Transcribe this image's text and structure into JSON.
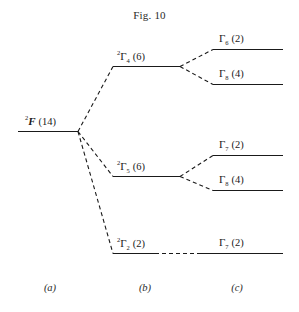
{
  "figure": {
    "title": "Fig. 10",
    "columns": [
      {
        "id": "a",
        "label": "(a)"
      },
      {
        "id": "b",
        "label": "(b)"
      },
      {
        "id": "c",
        "label": "(c)"
      }
    ],
    "levels": [
      {
        "id": "free-ion-2F",
        "column": "a",
        "prefix": "2",
        "symbol": "F",
        "subscript": "",
        "degeneracy": "(14)",
        "bold_italic": true
      },
      {
        "id": "gamma-4",
        "column": "b",
        "prefix": "2",
        "symbol": "Γ",
        "subscript": "4",
        "degeneracy": "(6)",
        "bold_italic": false
      },
      {
        "id": "gamma-5",
        "column": "b",
        "prefix": "2",
        "symbol": "Γ",
        "subscript": "5",
        "degeneracy": "(6)",
        "bold_italic": false
      },
      {
        "id": "gamma-2",
        "column": "b",
        "prefix": "2",
        "symbol": "Γ",
        "subscript": "2",
        "degeneracy": "(2)",
        "bold_italic": false
      },
      {
        "id": "gamma-6",
        "column": "c",
        "prefix": "",
        "symbol": "Γ",
        "subscript": "6",
        "degeneracy": "(2)",
        "bold_italic": false
      },
      {
        "id": "gamma-8-upper",
        "column": "c",
        "prefix": "",
        "symbol": "Γ",
        "subscript": "8",
        "degeneracy": "(4)",
        "bold_italic": false
      },
      {
        "id": "gamma-7-upper",
        "column": "c",
        "prefix": "",
        "symbol": "Γ",
        "subscript": "7",
        "degeneracy": "(2)",
        "bold_italic": false
      },
      {
        "id": "gamma-8-lower",
        "column": "c",
        "prefix": "",
        "symbol": "Γ",
        "subscript": "8",
        "degeneracy": "(4)",
        "bold_italic": false
      },
      {
        "id": "gamma-7-lower",
        "column": "c",
        "prefix": "",
        "symbol": "Γ",
        "subscript": "7",
        "degeneracy": "(2)",
        "bold_italic": false
      }
    ],
    "colors": {
      "ink": "#1a1a1a",
      "background": "#ffffff"
    }
  }
}
